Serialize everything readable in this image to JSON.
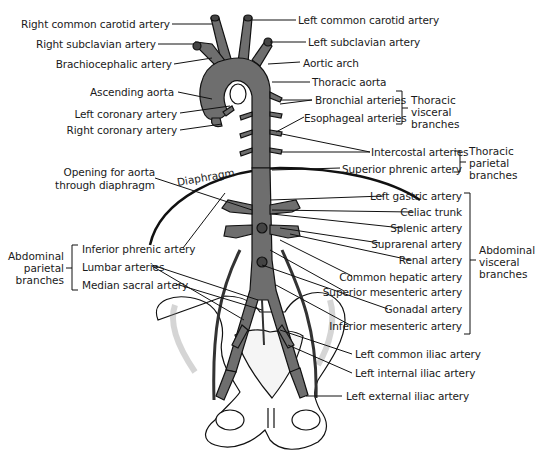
{
  "figure": {
    "colors": {
      "artery_fill": "#6e6e6e",
      "artery_outline": "#1a1a1a",
      "bone_fill": "#ffffff",
      "bone_shade": "#c8c8c8",
      "leader_line": "#1a1a1a",
      "background": "#ffffff"
    }
  },
  "labels_left": {
    "right_common_carotid": "Right common carotid artery",
    "right_subclavian": "Right subclavian artery",
    "brachiocephalic": "Brachiocephalic artery",
    "ascending_aorta": "Ascending aorta",
    "left_coronary": "Left coronary artery",
    "right_coronary": "Right coronary artery",
    "opening_line1": "Opening for aorta",
    "opening_line2": "through diaphragm",
    "inferior_phrenic": "Inferior phrenic artery",
    "lumbar": "Lumbar arteries",
    "median_sacral": "Median sacral artery"
  },
  "labels_right": {
    "left_common_carotid": "Left common carotid artery",
    "left_subclavian": "Left subclavian artery",
    "aortic_arch": "Aortic arch",
    "thoracic_aorta": "Thoracic aorta",
    "bronchial": "Bronchial arteries",
    "esophageal": "Esophageal arteries",
    "intercostal": "Intercostal arteries",
    "superior_phrenic": "Superior phrenic artery",
    "left_gastric": "Left gastric artery",
    "celiac_trunk": "Celiac trunk",
    "splenic": "Splenic artery",
    "suprarenal": "Suprarenal artery",
    "renal": "Renal artery",
    "common_hepatic": "Common hepatic artery",
    "superior_mesenteric": "Superior mesenteric artery",
    "gonadal": "Gonadal artery",
    "inferior_mesenteric": "Inferior mesenteric artery",
    "left_common_iliac": "Left common iliac artery",
    "left_internal_iliac": "Left internal iliac artery",
    "left_external_iliac": "Left external iliac artery"
  },
  "structures": {
    "diaphragm": "Diaphragm"
  },
  "groups": {
    "thoracic_visceral": [
      "Thoracic",
      "visceral",
      "branches"
    ],
    "thoracic_parietal": [
      "Thoracic",
      "parietal",
      "branches"
    ],
    "abdominal_visceral": [
      "Abdominal",
      "visceral",
      "branches"
    ],
    "abdominal_parietal": [
      "Abdominal",
      "parietal",
      "branches"
    ]
  }
}
